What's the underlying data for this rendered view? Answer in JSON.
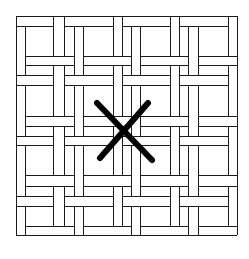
{
  "figure": {
    "stroke_color": "#1a1a1a",
    "x_mark_color": "#000000",
    "background": "#ffffff"
  },
  "lattice": {
    "outer_box": {
      "x1": 16,
      "y1": 16,
      "x2": 237,
      "y2": 235
    },
    "vertical_lines_x": [
      16,
      25,
      53,
      64,
      74,
      83,
      113,
      122,
      131,
      140,
      170,
      179,
      188,
      198,
      228,
      237
    ],
    "horizontal_lines_y": [
      16,
      26,
      56,
      65,
      75,
      85,
      116,
      126,
      136,
      145,
      175,
      186,
      196,
      206,
      226,
      235
    ]
  },
  "x_mark": {
    "stroke_a": {
      "x1": 97,
      "y1": 103,
      "x2": 152,
      "y2": 160
    },
    "stroke_b": {
      "x1": 148,
      "y1": 103,
      "x2": 100,
      "y2": 158
    }
  }
}
